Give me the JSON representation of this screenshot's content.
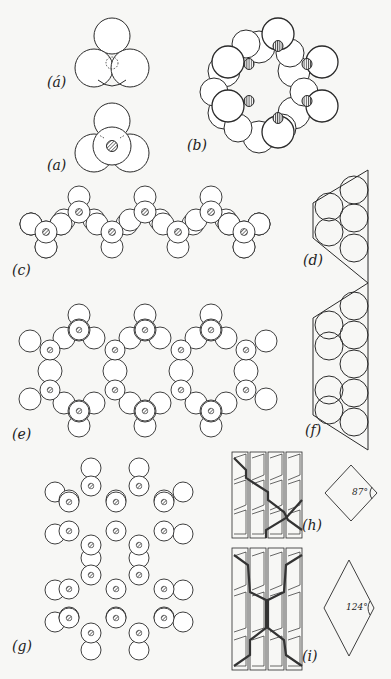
{
  "figure": {
    "panels": [
      {
        "id": "a_prime",
        "label": "(á)",
        "description": "three oxygen spheres with dotted central silicon"
      },
      {
        "id": "a",
        "label": "(a)",
        "description": "SiO4 tetrahedron with hatched central silicon"
      },
      {
        "id": "b",
        "label": "(b)",
        "description": "six-membered ring of tetrahedra"
      },
      {
        "id": "c",
        "label": "(c)",
        "description": "single chain of tetrahedra"
      },
      {
        "id": "d",
        "label": "(d)",
        "description": "single chain end view (trapezoid)"
      },
      {
        "id": "e",
        "label": "(e)",
        "description": "double chain of tetrahedra"
      },
      {
        "id": "f",
        "label": "(f)",
        "description": "double chain end view (trapezoid)"
      },
      {
        "id": "g",
        "label": "(g)",
        "description": "sheet structure of tetrahedra"
      },
      {
        "id": "h",
        "label": "(h)",
        "description": "pyroxene chain packing with cleavage",
        "angle": "87°"
      },
      {
        "id": "i",
        "label": "(i)",
        "description": "amphibole chain packing with cleavage",
        "angle": "124°"
      }
    ],
    "colors": {
      "background": "#f7f7f5",
      "stroke": "#2a2a2a",
      "heavy_line": "#333333"
    }
  }
}
